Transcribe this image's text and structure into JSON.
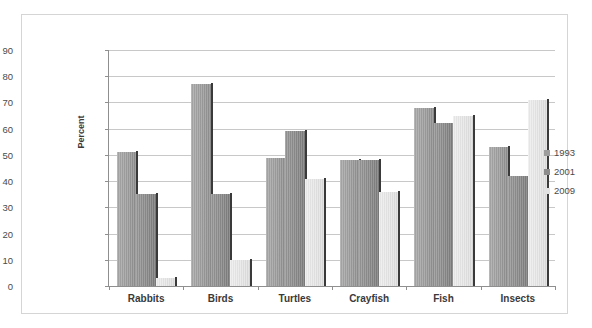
{
  "chart_data": {
    "type": "bar",
    "title": "",
    "xlabel": "",
    "ylabel": "Percent",
    "ylim": [
      0,
      90
    ],
    "ytick_step": 10,
    "yticks": [
      0,
      10,
      20,
      30,
      40,
      50,
      60,
      70,
      80,
      90
    ],
    "grid": true,
    "legend_position": "right",
    "categories": [
      "Rabbits",
      "Birds",
      "Turtles",
      "Crayfish",
      "Fish",
      "Insects"
    ],
    "series": [
      {
        "name": "1993",
        "color": "#9d9d9d",
        "values": [
          51,
          77,
          49,
          48,
          68,
          53
        ]
      },
      {
        "name": "2001",
        "color": "#8c8c8c",
        "values": [
          35,
          35,
          59,
          48,
          62,
          42
        ]
      },
      {
        "name": "2009",
        "color": "#e2e2e2",
        "values": [
          3,
          10,
          41,
          36,
          65,
          71
        ]
      }
    ]
  },
  "legend": {
    "items": [
      {
        "label": "1993"
      },
      {
        "label": "2001"
      },
      {
        "label": "2009"
      }
    ]
  }
}
